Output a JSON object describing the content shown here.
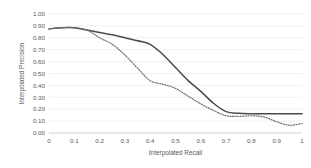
{
  "chart_data": {
    "type": "line",
    "title": "",
    "xlabel": "Interpolated Recall",
    "ylabel": "Interpolated Precision",
    "xlim": [
      0,
      1
    ],
    "ylim": [
      0,
      1
    ],
    "grid": true,
    "legend": "none",
    "x_ticks": [
      "0",
      "0.1",
      "0.2",
      "0.3",
      "0.4",
      "0.5",
      "0.6",
      "0.7",
      "0.8",
      "0.9",
      "1"
    ],
    "y_ticks": [
      "0.00",
      "0.10",
      "0.20",
      "0.30",
      "0.40",
      "0.50",
      "0.60",
      "0.70",
      "0.80",
      "0.90",
      "1.00"
    ],
    "x": [
      0,
      0.05,
      0.1,
      0.15,
      0.2,
      0.25,
      0.3,
      0.35,
      0.4,
      0.45,
      0.5,
      0.55,
      0.6,
      0.65,
      0.7,
      0.75,
      0.8,
      0.85,
      0.9,
      0.95,
      1
    ],
    "series": [
      {
        "name": "solid-curve",
        "style": "solid",
        "color": "#4b4b4b",
        "values": [
          0.875,
          0.885,
          0.885,
          0.865,
          0.845,
          0.825,
          0.8,
          0.775,
          0.745,
          0.66,
          0.55,
          0.44,
          0.35,
          0.25,
          0.18,
          0.165,
          0.162,
          0.162,
          0.162,
          0.162,
          0.162
        ]
      },
      {
        "name": "dotted-curve",
        "style": "dotted",
        "color": "#6e6e6e",
        "values": [
          0.875,
          0.885,
          0.885,
          0.865,
          0.8,
          0.745,
          0.655,
          0.545,
          0.44,
          0.41,
          0.375,
          0.31,
          0.245,
          0.19,
          0.145,
          0.14,
          0.145,
          0.135,
          0.095,
          0.065,
          0.08
        ]
      }
    ]
  },
  "axis": {
    "x_title": "Interpolated Recall",
    "y_title": "Interpolated Precision"
  }
}
